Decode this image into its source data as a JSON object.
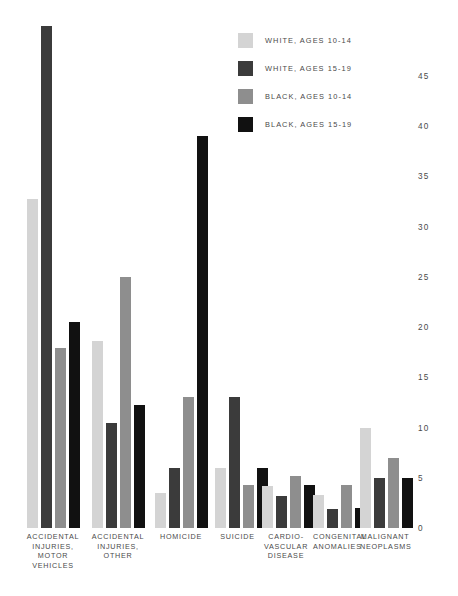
{
  "chart_data": {
    "type": "bar",
    "title": "",
    "subtitle": "",
    "xlabel": "",
    "ylabel": "",
    "ylim": [
      0,
      45
    ],
    "yticks": [
      0,
      5,
      10,
      15,
      20,
      25,
      30,
      35,
      40,
      45
    ],
    "grid": false,
    "legend_position": "top-right",
    "categories": [
      "ACCIDENTAL\nINJURIES,\nMOTOR\nVEHICLES",
      "ACCIDENTAL\nINJURIES,\nOTHER",
      "HOMICIDE",
      "SUICIDE",
      "CARDIO-\nVASCULAR\nDISEASE",
      "CONGENITAL\nANOMALIES",
      "MALIGNANT\nNEOPLASMS"
    ],
    "series": [
      {
        "name": "WHITE, AGES 10-14",
        "color": "#d4d4d4",
        "values": [
          32.8,
          18.6,
          3.5,
          6.0,
          4.2,
          3.3,
          10.0
        ]
      },
      {
        "name": "WHITE, AGES 15-19",
        "color": "#3b3b3b",
        "values": [
          50.0,
          10.5,
          6.0,
          13.0,
          3.2,
          1.9,
          5.0
        ]
      },
      {
        "name": "BLACK, AGES 10-14",
        "color": "#8e8e8e",
        "values": [
          17.9,
          25.0,
          13.0,
          4.3,
          5.2,
          4.3,
          7.0
        ]
      },
      {
        "name": "BLACK, AGES 15-19",
        "color": "#111111",
        "values": [
          20.5,
          12.2,
          39.0,
          6.0,
          4.3,
          2.0,
          5.0
        ]
      }
    ]
  },
  "legend": {
    "items": [
      {
        "label": "WHITE, AGES 10-14",
        "color": "#d4d4d4"
      },
      {
        "label": "WHITE, AGES 15-19",
        "color": "#3b3b3b"
      },
      {
        "label": "BLACK, AGES 10-14",
        "color": "#8e8e8e"
      },
      {
        "label": "BLACK, AGES 15-19",
        "color": "#111111"
      }
    ]
  },
  "axis": {
    "y_tick_labels": [
      "45",
      "40",
      "35",
      "30",
      "25",
      "20",
      "15",
      "10",
      "5",
      "0"
    ]
  },
  "category_labels": [
    [
      "ACCIDENTAL",
      "INJURIES,",
      "MOTOR",
      "VEHICLES"
    ],
    [
      "ACCIDENTAL",
      "INJURIES,",
      "OTHER"
    ],
    [
      "HOMICIDE"
    ],
    [
      "SUICIDE"
    ],
    [
      "CARDIO-",
      "VASCULAR",
      "DISEASE"
    ],
    [
      "CONGENITAL",
      "ANOMALIES"
    ],
    [
      "MALIGNANT",
      "NEOPLASMS"
    ]
  ]
}
